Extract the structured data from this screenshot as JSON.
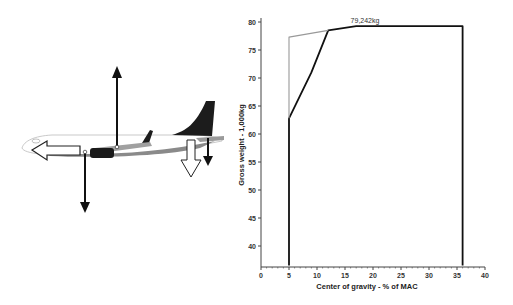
{
  "chart_data": {
    "type": "line",
    "title": "",
    "xlabel": "Center of gravity - % of MAC",
    "ylabel": "Gross weight - 1,000kg",
    "xlim": [
      0,
      40
    ],
    "ylim": [
      36.5,
      80
    ],
    "x_ticks": [
      "0",
      "5",
      "10",
      "15",
      "20",
      "25",
      "30",
      "35",
      "40"
    ],
    "y_ticks": [
      "40",
      "45",
      "50",
      "55",
      "60",
      "65",
      "70",
      "75",
      "80"
    ],
    "grid": false,
    "legend": null,
    "annotations": [
      {
        "text": "79,242kg",
        "x": 20,
        "y": 79.242
      }
    ],
    "series": [
      {
        "name": "envelope-outer (thick)",
        "color": "#111111",
        "points": [
          [
            5,
            36.5
          ],
          [
            5,
            62.8
          ],
          [
            9,
            71
          ],
          [
            12,
            78.5
          ],
          [
            17,
            79.242
          ],
          [
            36,
            79.242
          ],
          [
            36,
            36.5
          ]
        ]
      },
      {
        "name": "forward-limit (light)",
        "color": "#999999",
        "points": [
          [
            5,
            62.8
          ],
          [
            5,
            77.3
          ],
          [
            12,
            78.5
          ]
        ]
      }
    ]
  },
  "diagram": {
    "arrows": [
      "lift-up",
      "weight-down",
      "thrust-forward",
      "tail-download",
      "tail-weight-down"
    ]
  }
}
